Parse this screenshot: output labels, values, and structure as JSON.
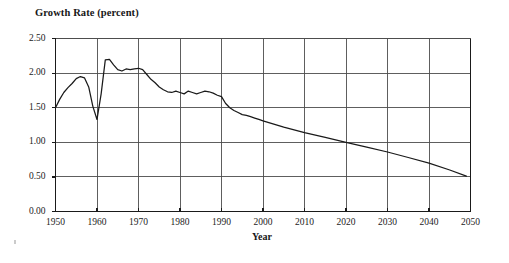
{
  "chart_data": {
    "type": "line",
    "title": "Growth Rate (percent)",
    "subtitle": "",
    "xlabel": "Year",
    "ylabel": "Growth Rate (percent)",
    "xlim": [
      1950,
      2050
    ],
    "ylim": [
      0.0,
      2.5
    ],
    "grid": true,
    "legend": null,
    "y_ticks": [
      "0.00",
      "0.50",
      "1.00",
      "1.50",
      "2.00",
      "2.50"
    ],
    "y_tick_values": [
      0.0,
      0.5,
      1.0,
      1.5,
      2.0,
      2.5
    ],
    "x_ticks": [
      "1950",
      "1960",
      "1970",
      "1980",
      "1990",
      "2000",
      "2010",
      "2020",
      "2030",
      "2040",
      "2050"
    ],
    "x_tick_values": [
      1950,
      1960,
      1970,
      1980,
      1990,
      2000,
      2010,
      2020,
      2030,
      2040,
      2050
    ],
    "series": [
      {
        "name": "World population growth rate",
        "color": "#1a1a1a",
        "x": [
          1950,
          1951,
          1952,
          1953,
          1954,
          1955,
          1956,
          1957,
          1958,
          1959,
          1960,
          1961,
          1962,
          1963,
          1964,
          1965,
          1966,
          1967,
          1968,
          1969,
          1970,
          1971,
          1972,
          1973,
          1974,
          1975,
          1976,
          1977,
          1978,
          1979,
          1980,
          1981,
          1982,
          1983,
          1984,
          1985,
          1986,
          1987,
          1988,
          1989,
          1990,
          1991,
          1992,
          1993,
          1994,
          1995,
          1996,
          1997,
          1998,
          1999,
          2000,
          2005,
          2010,
          2015,
          2020,
          2025,
          2030,
          2035,
          2040,
          2045,
          2049
        ],
        "values": [
          1.5,
          1.62,
          1.72,
          1.79,
          1.85,
          1.92,
          1.95,
          1.93,
          1.8,
          1.52,
          1.33,
          1.7,
          2.19,
          2.2,
          2.12,
          2.05,
          2.03,
          2.06,
          2.05,
          2.06,
          2.07,
          2.05,
          1.98,
          1.91,
          1.86,
          1.8,
          1.76,
          1.73,
          1.72,
          1.74,
          1.72,
          1.7,
          1.74,
          1.72,
          1.7,
          1.72,
          1.74,
          1.73,
          1.71,
          1.68,
          1.66,
          1.56,
          1.5,
          1.46,
          1.43,
          1.4,
          1.39,
          1.37,
          1.35,
          1.33,
          1.31,
          1.22,
          1.14,
          1.07,
          1.0,
          0.93,
          0.86,
          0.78,
          0.7,
          0.6,
          0.51
        ]
      }
    ]
  },
  "axes": {
    "title": "Growth Rate (percent)",
    "x_title": "Year"
  },
  "colors": {
    "line": "#1a1a1a",
    "grid": "#4d4d4d",
    "frame": "#1a1a1a",
    "background": "#ffffff"
  }
}
